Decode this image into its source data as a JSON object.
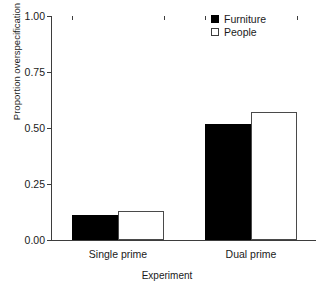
{
  "chart_data": {
    "type": "bar",
    "title": "",
    "xlabel": "Experiment",
    "ylabel": "Proportion overspecification",
    "categories": [
      "Single prime",
      "Dual prime"
    ],
    "series": [
      {
        "name": "Furniture",
        "values": [
          0.11,
          0.52
        ],
        "color": "#000000",
        "fill": "solid"
      },
      {
        "name": "People",
        "values": [
          0.13,
          0.57
        ],
        "color": "#ffffff",
        "fill": "hollow"
      }
    ],
    "ylim": [
      0.0,
      1.0
    ],
    "yticks": [
      0.0,
      0.25,
      0.5,
      0.75,
      1.0
    ],
    "ytick_labels": [
      "0.00",
      "0.25",
      "0.50",
      "0.75",
      "1.00"
    ],
    "grid": false,
    "legend_position": "top-right",
    "bar_group_gap": true
  },
  "legend": {
    "entries": [
      {
        "label": "Furniture",
        "swatch": "filled-square"
      },
      {
        "label": "People",
        "swatch": "hollow-square"
      }
    ]
  },
  "axes": {
    "y_title": "Proportion overspecification",
    "x_title": "Experiment"
  }
}
